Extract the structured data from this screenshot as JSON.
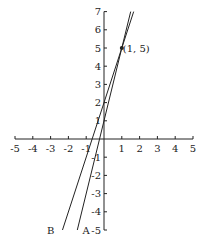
{
  "chart_data": {
    "type": "line",
    "title": "",
    "xlabel": "",
    "ylabel": "",
    "xlim": [
      -5,
      5
    ],
    "ylim": [
      -5,
      7
    ],
    "grid": false,
    "x_ticks": [
      -5,
      -4,
      -3,
      -2,
      -1,
      1,
      2,
      3,
      4,
      5
    ],
    "y_ticks": [
      -5,
      -4,
      -3,
      -2,
      -1,
      1,
      2,
      3,
      4,
      5,
      6,
      7
    ],
    "series": [
      {
        "name": "A",
        "equation": "y = 4x + 1",
        "slope": 4,
        "intercept": 1,
        "x": [
          -1.5,
          1.5
        ],
        "y": [
          -5,
          7
        ]
      },
      {
        "name": "B",
        "equation": "y = 3x + 2",
        "slope": 3,
        "intercept": 2,
        "x": [
          -2.333,
          1.667
        ],
        "y": [
          -5,
          7
        ]
      }
    ],
    "annotations": [
      {
        "text": "(1, 5)",
        "x": 1,
        "y": 5,
        "marker": "dot"
      }
    ],
    "line_labels": [
      {
        "text": "A",
        "x": -1.0,
        "y": -5
      },
      {
        "text": "B",
        "x": -3.0,
        "y": -5
      }
    ]
  },
  "labels": {
    "point": "(1, 5)",
    "line_a": "A",
    "line_b": "B"
  },
  "colors": {
    "ink": "#222222",
    "background": "#ffffff"
  }
}
